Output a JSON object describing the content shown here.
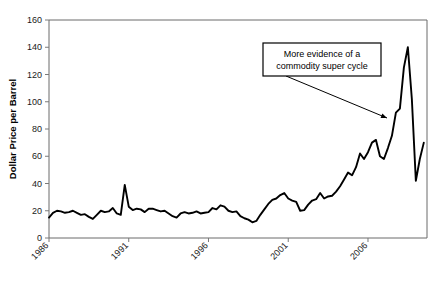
{
  "chart_data": {
    "type": "line",
    "title": "",
    "xlabel": "",
    "ylabel": "Dollar Price per Barrel",
    "ylim": [
      0,
      160
    ],
    "yticks": [
      0,
      20,
      40,
      60,
      80,
      100,
      120,
      140,
      160
    ],
    "xlim": [
      1986,
      2009.7
    ],
    "xticks": [
      1986,
      1991,
      1996,
      2001,
      2006
    ],
    "xtick_labels": [
      "1986",
      "1991",
      "1996",
      "2001",
      "2006"
    ],
    "grid": false,
    "legend": null,
    "series": [
      {
        "name": "Dollar Price per Barrel",
        "x": [
          1986.0,
          1986.25,
          1986.5,
          1986.75,
          1987.0,
          1987.25,
          1987.5,
          1987.75,
          1988.0,
          1988.25,
          1988.5,
          1988.75,
          1989.0,
          1989.25,
          1989.5,
          1989.75,
          1990.0,
          1990.25,
          1990.5,
          1990.75,
          1991.0,
          1991.25,
          1991.5,
          1991.75,
          1992.0,
          1992.25,
          1992.5,
          1992.75,
          1993.0,
          1993.25,
          1993.5,
          1993.75,
          1994.0,
          1994.25,
          1994.5,
          1994.75,
          1995.0,
          1995.25,
          1995.5,
          1995.75,
          1996.0,
          1996.25,
          1996.5,
          1996.75,
          1997.0,
          1997.25,
          1997.5,
          1997.75,
          1998.0,
          1998.25,
          1998.5,
          1998.75,
          1999.0,
          1999.25,
          1999.5,
          1999.75,
          2000.0,
          2000.25,
          2000.5,
          2000.75,
          2001.0,
          2001.25,
          2001.5,
          2001.75,
          2002.0,
          2002.25,
          2002.5,
          2002.75,
          2003.0,
          2003.25,
          2003.5,
          2003.75,
          2004.0,
          2004.25,
          2004.5,
          2004.75,
          2005.0,
          2005.25,
          2005.5,
          2005.75,
          2006.0,
          2006.25,
          2006.5,
          2006.75,
          2007.0,
          2007.25,
          2007.5,
          2007.75,
          2008.0,
          2008.25,
          2008.5,
          2008.75,
          2009.0,
          2009.25,
          2009.5
        ],
        "values": [
          15.0,
          18.5,
          20.0,
          19.5,
          18.5,
          19.0,
          20.0,
          18.5,
          17.0,
          17.5,
          15.5,
          14.0,
          17.0,
          20.0,
          19.0,
          19.5,
          22.0,
          18.0,
          17.0,
          39.0,
          23.0,
          20.5,
          21.5,
          21.0,
          19.0,
          21.5,
          21.5,
          20.5,
          19.5,
          20.0,
          18.0,
          16.0,
          15.0,
          18.0,
          19.0,
          18.0,
          18.5,
          19.5,
          18.0,
          18.5,
          19.0,
          22.0,
          21.0,
          24.0,
          23.0,
          20.0,
          19.0,
          19.5,
          16.0,
          14.5,
          13.5,
          11.5,
          12.5,
          17.0,
          21.0,
          25.0,
          28.0,
          29.0,
          31.5,
          33.0,
          29.0,
          27.5,
          26.5,
          20.0,
          20.5,
          24.5,
          27.5,
          28.5,
          33.0,
          29.0,
          30.5,
          31.0,
          34.0,
          38.0,
          43.0,
          48.0,
          46.0,
          52.0,
          62.0,
          58.0,
          63.0,
          70.0,
          72.0,
          60.0,
          58.0,
          66.0,
          75.0,
          92.0,
          95.0,
          125.0,
          140.0,
          102.0,
          42.0,
          58.0,
          70.0
        ]
      }
    ],
    "annotations": [
      {
        "name": "commodity-super-cycle-callout",
        "lines": [
          "More evidence of a",
          "commodity super cycle"
        ],
        "box": {
          "x": 263,
          "y": 43,
          "width": 118,
          "height": 33
        },
        "leader_from": {
          "x": 286,
          "y": 76
        },
        "leader_to": {
          "x": 387,
          "y": 118
        }
      }
    ]
  },
  "axes": {
    "plot": {
      "left": 49,
      "top": 20,
      "right": 427,
      "bottom": 238
    }
  }
}
